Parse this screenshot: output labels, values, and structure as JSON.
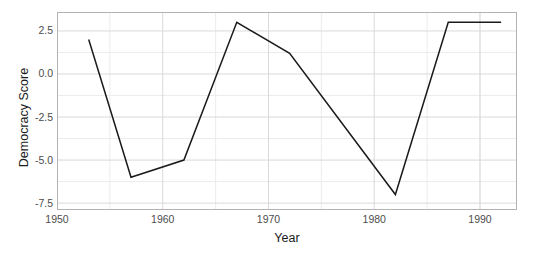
{
  "chart_data": {
    "type": "line",
    "title": "",
    "xlabel": "Year",
    "ylabel": "Democracy Score",
    "xlim": [
      1950,
      1993.5
    ],
    "ylim": [
      -7.9,
      3.6
    ],
    "xticks": [
      1950,
      1960,
      1970,
      1980,
      1990
    ],
    "xtick_labels": [
      "1950",
      "1960",
      "1970",
      "1980",
      "1990"
    ],
    "yticks": [
      2.5,
      0.0,
      -2.5,
      -5.0,
      -7.5
    ],
    "ytick_labels": [
      "2.5",
      "0.0",
      "-2.5",
      "-5.0",
      "-7.5"
    ],
    "minor_xticks": [
      1955,
      1965,
      1975,
      1985,
      1990
    ],
    "minor_yticks": [
      1.25,
      -1.25,
      -3.75,
      -6.25
    ],
    "grid": true,
    "legend": "none",
    "series": [
      {
        "name": "Democracy Score",
        "color": "#1a1a1a",
        "x": [
          1953,
          1957,
          1962,
          1967,
          1972,
          1982,
          1987,
          1992
        ],
        "values": [
          2.0,
          -6.0,
          -5.0,
          3.0,
          1.2,
          -7.0,
          3.0,
          3.0
        ]
      }
    ]
  },
  "style": {
    "panel_background": "#ffffff",
    "panel_border": "#b3b3b3",
    "gridline_major": "#d9d9d9",
    "gridline_minor": "#ececec",
    "line_color": "#1a1a1a",
    "tick_text": "#4d4d4d",
    "axis_title": "#1a1a1a"
  }
}
